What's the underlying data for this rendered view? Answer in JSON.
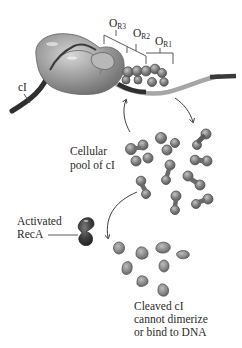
{
  "labels": {
    "operator_prefix": "O",
    "or3_sub": "R3",
    "or2_sub": "R2",
    "or1_sub": "R1",
    "ci": "cI",
    "pool_line1": "Cellular",
    "pool_line2": "pool of cI",
    "reca_line1": "Activated",
    "reca_line2": "RecA",
    "cleaved_line1": "Cleaved cI",
    "cleaved_line2": "cannot dimerize",
    "cleaved_line3": "or bind to DNA"
  },
  "colors": {
    "polymerase": "#9a9a9a",
    "dimer": "#7e7e7e",
    "monomer": "#8a8a8a",
    "reca": "#3f3f3f",
    "dna_light": "#a8a8a8",
    "dna_dark": "#3a3a3a",
    "text": "#2a2a2a"
  },
  "components": [
    {
      "name": "RNA polymerase bound at operator",
      "icon": "polymerase-icon"
    },
    {
      "name": "cI dimers bound at OR1/OR2",
      "icon": "bound-dimer-icon"
    },
    {
      "name": "Cellular pool of cI dimers",
      "icon": "dimer-icon",
      "count": 10
    },
    {
      "name": "Activated RecA",
      "icon": "reca-icon"
    },
    {
      "name": "Cleaved cI monomers",
      "icon": "monomer-icon",
      "count": 8
    }
  ]
}
